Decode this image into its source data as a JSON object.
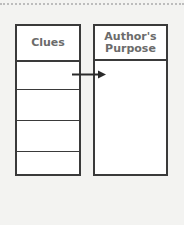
{
  "diagram": {
    "left_column": {
      "title": "Clues",
      "rows": 5
    },
    "right_column": {
      "title": "Author's Purpose"
    },
    "connector": "arrow from Clues row 1 to Author's Purpose",
    "colors": {
      "line": "#3a3a3a",
      "text": "#6b6b6b",
      "background": "#f3f3f1",
      "fill": "#ffffff"
    }
  }
}
